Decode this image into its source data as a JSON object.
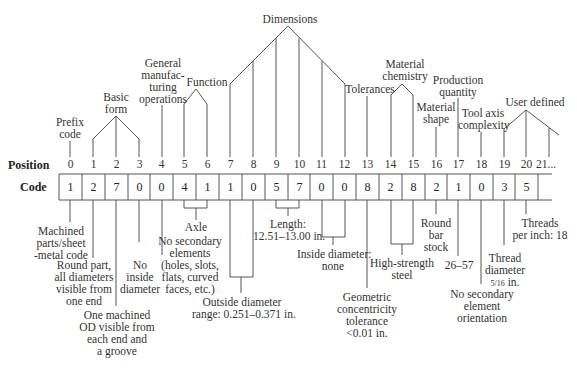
{
  "row_headers": {
    "position": "Position",
    "code": "Code"
  },
  "positions": [
    "0",
    "1",
    "2",
    "3",
    "4",
    "5",
    "6",
    "7",
    "8",
    "9",
    "10",
    "11",
    "12",
    "13",
    "14",
    "15",
    "16",
    "17",
    "18",
    "19",
    "20",
    "21..."
  ],
  "code_values": [
    "1",
    "2",
    "7",
    "0",
    "0",
    "4",
    "1",
    "1",
    "0",
    "5",
    "7",
    "0",
    "0",
    "8",
    "2",
    "8",
    "2",
    "1",
    "0",
    "3",
    "5"
  ],
  "top_labels": {
    "prefix_code": [
      "Prefix",
      "code"
    ],
    "basic_form": [
      "Basic",
      "form"
    ],
    "general_manufacturing_operations": [
      "General",
      "manufac-",
      "turing",
      "operations"
    ],
    "function": [
      "Function"
    ],
    "dimensions": [
      "Dimensions"
    ],
    "tolerances": [
      "Tolerances"
    ],
    "material_chemistry": [
      "Material",
      "chemistry"
    ],
    "production_quantity": [
      "Production",
      "quantity"
    ],
    "material_shape": [
      "Material",
      "shape"
    ],
    "tool_axis_complexity": [
      "Tool axis",
      "complexity"
    ],
    "user_defined": [
      "User defined"
    ]
  },
  "bottom_labels": {
    "machined_parts": [
      "Machined",
      "parts/sheet",
      "-metal code"
    ],
    "round_part": [
      "Round part,",
      "all diameters",
      "visible from",
      "one end"
    ],
    "one_machined_od": [
      "One machined",
      "OD visible from",
      "each end and",
      "a groove"
    ],
    "no_inside_diameter": [
      "No",
      "inside",
      "diameter"
    ],
    "no_secondary_elements": [
      "No secondary",
      "elements",
      "(holes, slots,",
      "flats, curved",
      "faces, etc.)"
    ],
    "axle": [
      "Axle"
    ],
    "outside_diameter": [
      "Outside diameter",
      "range: 0.251–0.371 in."
    ],
    "length": [
      "Length:",
      "12.51–13.00 in."
    ],
    "inside_diameter_none": [
      "Inside diameter:",
      "none"
    ],
    "geometric_concentricity": [
      "Geometric",
      "concentricity",
      "tolerance",
      "<0.01 in."
    ],
    "high_strength_steel": [
      "High-strength",
      "steel"
    ],
    "round_bar_stock": [
      "Round",
      "bar",
      "stock"
    ],
    "quantity_range": [
      "26–57"
    ],
    "no_secondary_orientation": [
      "No secondary",
      "element",
      "orientation"
    ],
    "thread_diameter": [
      "Thread",
      "diameter"
    ],
    "thread_diameter_value": "5/16",
    "thread_diameter_unit": " in.",
    "threads_per_inch": [
      "Threads",
      "per inch: 18"
    ]
  }
}
